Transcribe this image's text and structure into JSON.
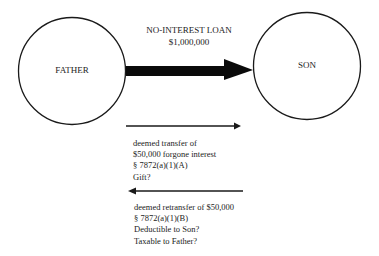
{
  "nodes": {
    "father": {
      "label": "FATHER"
    },
    "son": {
      "label": "SON"
    }
  },
  "loan": {
    "title": "NO-INTEREST LOAN",
    "amount": "$1,000,000"
  },
  "transfer": {
    "direction": "father-to-son",
    "lines": [
      "deemed transfer of",
      "$50,000 forgone interest",
      "§ 7872(a)(1)(A)",
      "Gift?"
    ]
  },
  "retransfer": {
    "direction": "son-to-father",
    "lines": [
      "deemed retransfer of $50,000",
      "§ 7872(a)(1)(B)",
      "Deductible to Son?",
      "Taxable to Father?"
    ]
  },
  "colors": {
    "stroke": "#1a1a1a",
    "background": "#ffffff"
  }
}
